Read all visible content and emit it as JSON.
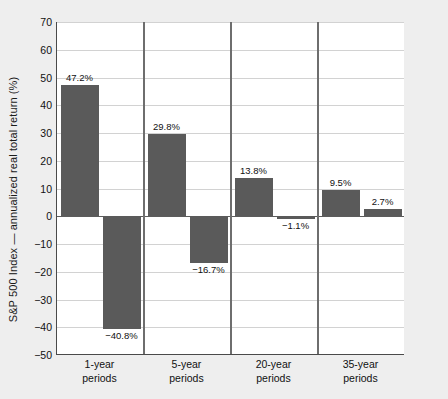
{
  "chart_data": {
    "type": "bar",
    "title": "",
    "subtitle": "",
    "xlabel": "",
    "ylabel": "S&P 500 Index — annualized real total return (%)",
    "ylim": [
      -50,
      70
    ],
    "ytick_step": 10,
    "yticks": [
      "70",
      "60",
      "50",
      "40",
      "30",
      "20",
      "10",
      "0",
      "−10",
      "−20",
      "−30",
      "−40",
      "−50"
    ],
    "grid": true,
    "grid_axis": "y",
    "legend": "none",
    "group_separators": true,
    "categories": [
      "1-year periods",
      "5-year periods",
      "20-year periods",
      "35-year periods"
    ],
    "groups": [
      {
        "category": "1-year periods",
        "line1": "1-year",
        "line2": "periods",
        "bars": [
          {
            "role": "best",
            "value": 47.2,
            "label": "47.2%"
          },
          {
            "role": "worst",
            "value": -40.8,
            "label": "−40.8%"
          }
        ]
      },
      {
        "category": "5-year periods",
        "line1": "5-year",
        "line2": "periods",
        "bars": [
          {
            "role": "best",
            "value": 29.8,
            "label": "29.8%"
          },
          {
            "role": "worst",
            "value": -16.7,
            "label": "−16.7%"
          }
        ]
      },
      {
        "category": "20-year periods",
        "line1": "20-year",
        "line2": "periods",
        "bars": [
          {
            "role": "best",
            "value": 13.8,
            "label": "13.8%"
          },
          {
            "role": "worst",
            "value": -1.1,
            "label": "−1.1%"
          }
        ]
      },
      {
        "category": "35-year periods",
        "line1": "35-year",
        "line2": "periods",
        "bars": [
          {
            "role": "best",
            "value": 9.5,
            "label": "9.5%"
          },
          {
            "role": "worst",
            "value": 2.7,
            "label": "2.7%"
          }
        ]
      }
    ],
    "colors": {
      "bar": "#5a5a5a",
      "plot_background": "#ffffff",
      "figure_background": "#eeeeee",
      "gridline": "#d2d2d2",
      "axis": "#4a4a4a",
      "separator": "#6e6e6e",
      "text": "#111111"
    }
  }
}
